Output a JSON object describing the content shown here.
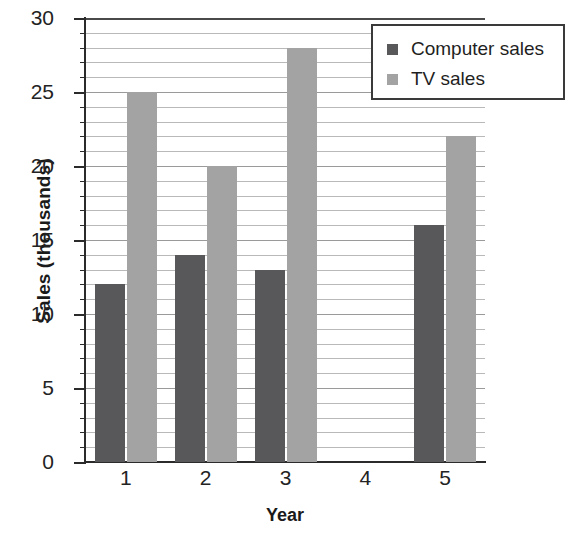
{
  "chart_data": {
    "type": "bar",
    "title": "",
    "xlabel": "Year",
    "ylabel": "Sales (thousands)",
    "categories": [
      "1",
      "2",
      "3",
      "4",
      "5"
    ],
    "series": [
      {
        "name": "Computer sales",
        "values": [
          12,
          14,
          13,
          0,
          16
        ],
        "color": "#58585a"
      },
      {
        "name": "TV sales",
        "values": [
          25,
          20,
          28,
          0,
          22
        ],
        "color": "#a3a3a3"
      }
    ],
    "ylim": [
      0,
      30
    ],
    "ytick_labels": [
      "0",
      "5",
      "10",
      "15",
      "20",
      "25",
      "30"
    ],
    "ytick_values": [
      0,
      5,
      10,
      15,
      20,
      25,
      30
    ],
    "ytick_step_minor": 1,
    "grid": true,
    "grid_orientation": "horizontal",
    "legend_position": "top-right"
  },
  "legend": {
    "entries": [
      {
        "label": "Computer sales"
      },
      {
        "label": "TV sales"
      }
    ]
  },
  "axes": {
    "x_title": "Year",
    "y_title": "Sales (thousands)"
  }
}
